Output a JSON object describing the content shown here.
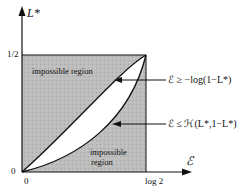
{
  "diagram": {
    "y_axis_label": "L*",
    "x_axis_label": "ℰ",
    "y_ticks": [
      "1/2",
      "0"
    ],
    "x_ticks": [
      "0",
      "log 2"
    ],
    "regions": {
      "upper": "impossible region",
      "lower_line1": "impossible",
      "lower_line2": "region"
    },
    "annotations": {
      "upper_bound": "ℰ ≥ −log(1−L*)",
      "lower_bound": "ℰ ≤ ℋ(L*,1−L*)"
    },
    "colors": {
      "shade": "#b9b9b9",
      "line": "#111111"
    }
  }
}
